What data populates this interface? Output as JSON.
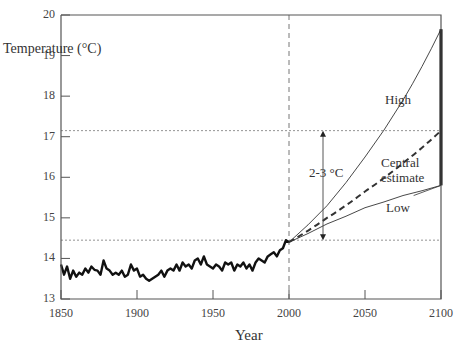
{
  "chart_data": {
    "type": "line",
    "title": "",
    "xlabel": "Year",
    "ylabel": "Temperature (°C)",
    "xlim": [
      1850,
      2100
    ],
    "ylim": [
      13,
      20
    ],
    "x_ticks": [
      "1850",
      "1900",
      "1950",
      "2000",
      "2050",
      "2100"
    ],
    "y_ticks": [
      "13",
      "14",
      "15",
      "16",
      "17",
      "18",
      "19",
      "20"
    ],
    "grid": false,
    "reference_lines": {
      "horizontal": [
        14.45,
        17.15
      ],
      "vertical": [
        2000
      ]
    },
    "annotations": [
      {
        "text": "High",
        "x": 2078,
        "y": 17.9
      },
      {
        "text": "Central",
        "x": 2078,
        "y": 16.35
      },
      {
        "text": "estimate",
        "x": 2078,
        "y": 16.0
      },
      {
        "text": "Low",
        "x": 2073,
        "y": 15.3
      },
      {
        "text": "2-3 °C",
        "x": 2018,
        "y": 16.3,
        "arrow_from": 14.45,
        "arrow_to": 17.15
      }
    ],
    "range_bar": {
      "x": 2100,
      "from": 15.8,
      "to": 19.65
    },
    "series": [
      {
        "name": "Observed",
        "style": "solid-thick",
        "x": [
          1850,
          1852,
          1854,
          1856,
          1858,
          1860,
          1862,
          1864,
          1866,
          1868,
          1870,
          1872,
          1874,
          1876,
          1878,
          1880,
          1882,
          1884,
          1886,
          1888,
          1890,
          1892,
          1894,
          1896,
          1898,
          1900,
          1902,
          1904,
          1906,
          1908,
          1910,
          1912,
          1914,
          1916,
          1918,
          1920,
          1922,
          1924,
          1926,
          1928,
          1930,
          1932,
          1934,
          1936,
          1938,
          1940,
          1942,
          1944,
          1946,
          1948,
          1950,
          1952,
          1954,
          1956,
          1958,
          1960,
          1962,
          1964,
          1966,
          1968,
          1970,
          1972,
          1974,
          1976,
          1978,
          1980,
          1982,
          1984,
          1986,
          1988,
          1990,
          1992,
          1994,
          1996,
          1998,
          2000
        ],
        "y": [
          13.85,
          13.6,
          13.8,
          13.5,
          13.7,
          13.55,
          13.65,
          13.6,
          13.75,
          13.65,
          13.8,
          13.72,
          13.7,
          13.6,
          13.95,
          13.75,
          13.7,
          13.6,
          13.65,
          13.6,
          13.7,
          13.55,
          13.6,
          13.85,
          13.7,
          13.75,
          13.55,
          13.6,
          13.5,
          13.45,
          13.5,
          13.55,
          13.6,
          13.7,
          13.55,
          13.7,
          13.75,
          13.7,
          13.85,
          13.7,
          13.9,
          13.8,
          13.85,
          13.75,
          13.95,
          14.0,
          13.85,
          14.05,
          13.85,
          13.8,
          13.75,
          13.85,
          13.8,
          13.7,
          13.9,
          13.85,
          13.9,
          13.7,
          13.85,
          13.8,
          13.9,
          13.75,
          13.85,
          13.7,
          13.9,
          14.0,
          13.95,
          13.9,
          14.05,
          14.1,
          14.15,
          14.05,
          14.2,
          14.25,
          14.45,
          14.4
        ]
      },
      {
        "name": "High",
        "style": "solid-thin",
        "x": [
          2000,
          2025,
          2050,
          2075,
          2100
        ],
        "y": [
          14.4,
          15.3,
          16.5,
          17.9,
          19.65
        ]
      },
      {
        "name": "Central estimate",
        "style": "dashed-thick",
        "x": [
          2000,
          2025,
          2050,
          2075,
          2100
        ],
        "y": [
          14.4,
          15.0,
          15.65,
          16.35,
          17.15
        ]
      },
      {
        "name": "Low",
        "style": "solid-thin",
        "x": [
          2000,
          2025,
          2050,
          2075,
          2100
        ],
        "y": [
          14.4,
          14.85,
          15.25,
          15.55,
          15.8
        ]
      }
    ]
  },
  "labels": {
    "ylabel": "Temperature (°C)",
    "xlabel": "Year",
    "high": "High",
    "central1": "Central",
    "central2": "estimate",
    "low": "Low",
    "delta": "2-3 °C"
  },
  "colors": {
    "axis": "#555555",
    "observed": "#111111",
    "projection": "#333333",
    "reference": "#777777"
  }
}
